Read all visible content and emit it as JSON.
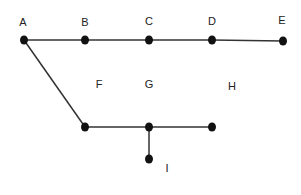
{
  "diagram": {
    "type": "graph",
    "nodes": [
      {
        "id": "A",
        "label": "A",
        "x": 24,
        "y": 40,
        "lx": 23,
        "ly": 26
      },
      {
        "id": "B",
        "label": "B",
        "x": 85,
        "y": 40,
        "lx": 85,
        "ly": 26
      },
      {
        "id": "C",
        "label": "C",
        "x": 149,
        "y": 40,
        "lx": 149,
        "ly": 25
      },
      {
        "id": "D",
        "label": "D",
        "x": 212,
        "y": 40,
        "lx": 212,
        "ly": 25
      },
      {
        "id": "E",
        "label": "E",
        "x": 283,
        "y": 41,
        "lx": 282,
        "ly": 24
      },
      {
        "id": "F",
        "label": "F",
        "x": 85,
        "y": 127,
        "lx": 99,
        "ly": 88
      },
      {
        "id": "G",
        "label": "G",
        "x": 149,
        "y": 127,
        "lx": 149,
        "ly": 88
      },
      {
        "id": "H",
        "label": "H",
        "x": 212,
        "y": 127,
        "lx": 232,
        "ly": 90
      },
      {
        "id": "I",
        "label": "I",
        "x": 149,
        "y": 159,
        "lx": 167,
        "ly": 172
      }
    ],
    "edges": [
      {
        "from": "A",
        "to": "B"
      },
      {
        "from": "B",
        "to": "C"
      },
      {
        "from": "C",
        "to": "D"
      },
      {
        "from": "D",
        "to": "E"
      },
      {
        "from": "A",
        "to": "F"
      },
      {
        "from": "F",
        "to": "G"
      },
      {
        "from": "G",
        "to": "H"
      },
      {
        "from": "G",
        "to": "I"
      }
    ]
  }
}
